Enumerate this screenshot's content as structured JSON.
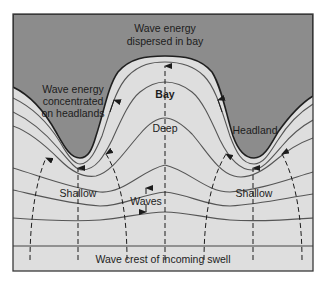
{
  "diagram": {
    "colors": {
      "land": "#8c8c8c",
      "water": "#dedede",
      "line": "#4a4a4a",
      "frame": "#3a3a3a",
      "text": "#1c1c1c"
    },
    "labels": {
      "dispersed_line1": "Wave energy",
      "dispersed_line2": "dispersed in bay",
      "concentrated_line1": "Wave energy",
      "concentrated_line2": "concentrated",
      "concentrated_line3": "on headlands",
      "bay": "Bay",
      "deep": "Deep",
      "headland": "Headland",
      "shallow_left": "Shallow",
      "shallow_right": "Shallow",
      "waves": "Waves",
      "incoming_swell": "Wave crest of incoming swell"
    },
    "regions": [
      {
        "name": "bay",
        "depth": "Deep"
      },
      {
        "name": "left-headland",
        "depth": "Shallow"
      },
      {
        "name": "right-headland",
        "depth": "Shallow"
      }
    ],
    "wave_crest_count": 6,
    "orthogonal_count": 7
  }
}
